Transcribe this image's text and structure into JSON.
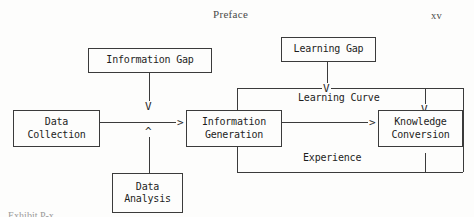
{
  "page": {
    "running_head": "Preface",
    "page_number": "xv",
    "background_color": "#fdfdfc",
    "ink_color": "#1d1d1d"
  },
  "diagram": {
    "type": "flow-diagram",
    "nodes": [
      {
        "id": "information-gap",
        "label": "Information Gap"
      },
      {
        "id": "learning-gap",
        "label": "Learning Gap"
      },
      {
        "id": "data-collection",
        "label": "Data\nCollection"
      },
      {
        "id": "information-generation",
        "label": "Information\nGeneration"
      },
      {
        "id": "knowledge-conversion",
        "label": "Knowledge\nConversion"
      },
      {
        "id": "data-analysis",
        "label": "Data\nAnalysis"
      }
    ],
    "edge_labels": [
      {
        "id": "learning-curve",
        "label": "Learning Curve"
      },
      {
        "id": "experience",
        "label": "Experience"
      }
    ],
    "arrowheads": {
      "right": ">",
      "down": "V",
      "up": "^"
    },
    "edges": [
      {
        "from": "data-collection",
        "to": "information-generation",
        "head": ">"
      },
      {
        "from": "information-gap",
        "to": "data-collection-edge",
        "head": "V"
      },
      {
        "from": "data-analysis",
        "to": "data-collection-edge",
        "head": "^"
      },
      {
        "from": "information-generation",
        "to": "knowledge-conversion",
        "head": ">"
      },
      {
        "from": "learning-gap",
        "to": "learning-curve-edge",
        "head": "V"
      },
      {
        "from": "learning-curve",
        "to": "knowledge-conversion",
        "head": "V"
      },
      {
        "from": "experience",
        "to": "knowledge-conversion",
        "head": "^"
      }
    ]
  },
  "caption": {
    "clipped_text": "Exhibit P-x"
  }
}
